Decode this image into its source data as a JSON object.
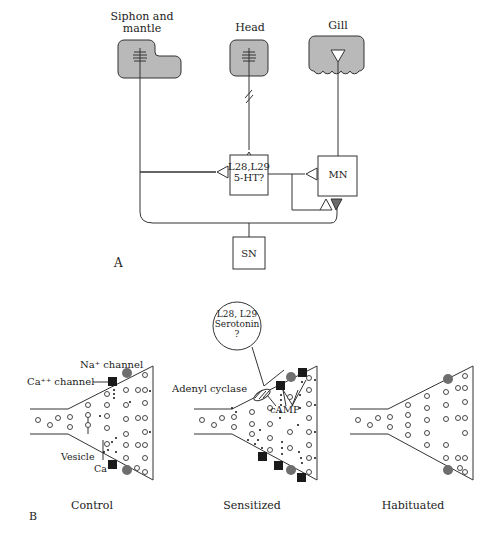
{
  "panel_a": {
    "label": "A",
    "organs": {
      "siphon": "Siphon and\nmantle",
      "siphon_line1": "Siphon and",
      "siphon_line2": "mantle",
      "head": "Head",
      "gill": "Gill"
    },
    "neurons": {
      "interneuron_line1": "L28,L29",
      "interneuron_line2": "5-HT?",
      "motor": "MN",
      "sensory": "SN"
    }
  },
  "panel_b": {
    "label": "B",
    "annotations": {
      "na_channel": "Na⁺ channel",
      "ca_channel": "Ca⁺⁺ channel",
      "vesicle": "Vesicle",
      "ca_ion": "Ca⁺⁺",
      "adenyl_cyclase": "Adenyl cyclase",
      "camp": "cAMP",
      "bubble_line1": "L28, L29",
      "bubble_line2": "Serotonin",
      "bubble_line3": "?"
    },
    "conditions": [
      "Control",
      "Sensitized",
      "Habituated"
    ]
  },
  "colors": {
    "organ_fill": "#b9b9b9",
    "line": "#333333",
    "channel_square": "#1a1a1a",
    "channel_hex": "#6e6e6e",
    "inhibitory_terminal": "#6a6a6a"
  }
}
